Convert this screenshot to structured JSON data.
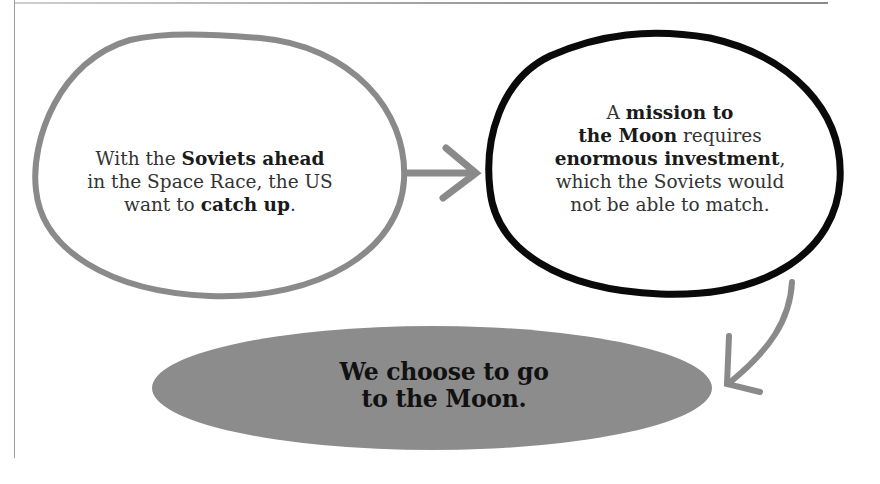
{
  "diagram": {
    "bubble_1": {
      "parts": [
        {
          "text": "With the ",
          "bold": false
        },
        {
          "text": "Soviets ahead",
          "bold": true
        },
        {
          "text": " in the Space Race, the US want to ",
          "bold": false
        },
        {
          "text": "catch up",
          "bold": true
        },
        {
          "text": ".",
          "bold": false
        }
      ],
      "line1_a": "With the ",
      "line1_b": "Soviets ahead",
      "line2": "in the Space Race, the US",
      "line3_a": "want to ",
      "line3_b": "catch up",
      "line3_c": "."
    },
    "bubble_2": {
      "line1_a": "A ",
      "line1_b": "mission to",
      "line2_a": "the Moon",
      "line2_b": " requires",
      "line3_a": "enormous investment",
      "line3_b": ",",
      "line4": "which the Soviets would",
      "line5": "not be able to match."
    },
    "conclusion": {
      "line1": "We choose to go",
      "line2": "to the Moon."
    },
    "arrows": [
      {
        "from": "bubble_1",
        "to": "bubble_2",
        "icon": "arrow-right-icon"
      },
      {
        "from": "bubble_2",
        "to": "conclusion",
        "icon": "curved-arrow-down-icon"
      }
    ],
    "colors": {
      "gray_outline": "#8a8a8a",
      "black_outline": "#0a0a0a",
      "conclusion_fill": "#8c8c8c"
    }
  }
}
